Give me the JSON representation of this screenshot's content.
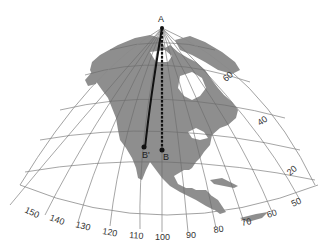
{
  "map": {
    "type": "conic projection of North America with graticule",
    "colors": {
      "land": "#8e8e8e",
      "water": "#ffffff",
      "graticule": "#6a6a6a",
      "route": "#111111"
    },
    "points": {
      "A": {
        "label": "A"
      },
      "B": {
        "label": "B"
      },
      "B_prime": {
        "label": "B'"
      }
    },
    "routes": [
      {
        "name": "great-circle-route",
        "from": "A",
        "to": "B'",
        "style": "solid curve"
      },
      {
        "name": "straight-line-route",
        "from": "A",
        "to": "B",
        "style": "dashed straight"
      }
    ],
    "longitude_labels": [
      "150",
      "140",
      "130",
      "120",
      "110",
      "100",
      "90",
      "80",
      "70",
      "60",
      "50"
    ],
    "latitude_labels": [
      "60",
      "40",
      "20"
    ]
  }
}
